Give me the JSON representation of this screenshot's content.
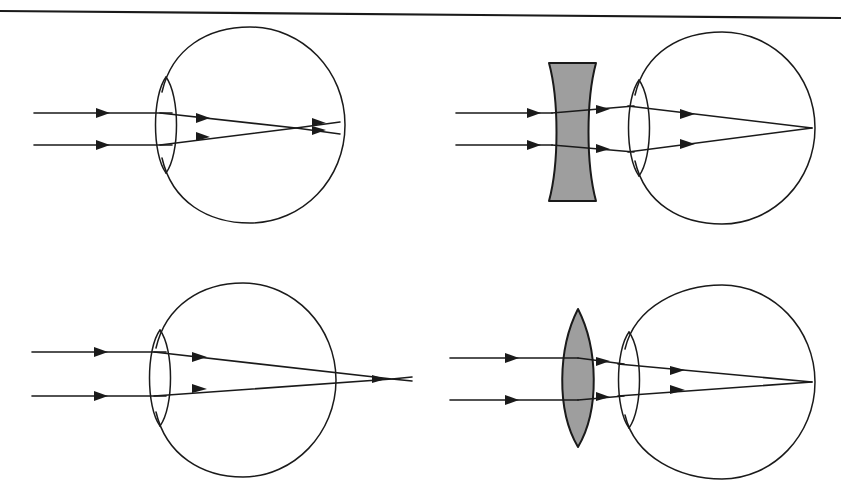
{
  "figure": {
    "kind": "optics-diagram",
    "width": 841,
    "height": 502,
    "background_color": "#ffffff",
    "ink_color": "#1a1a1a",
    "lens_fill_color": "#9e9e9e",
    "scan_edge_color": "#a8a8a8",
    "panel_count": 4
  },
  "scan_edge": {
    "name": "page-top-border",
    "x1": 0,
    "y1": 11,
    "x2": 841,
    "y2": 18,
    "color": "#a8a8a8"
  },
  "panels": [
    {
      "id": "top-left",
      "name": "myopia-uncorrected",
      "condition": "myopia",
      "corrective_lens": "none",
      "focal_point_relative_to_retina": "in front of retina",
      "eye": {
        "globe_cx": 250,
        "globe_cy": 125,
        "globe_rx": 95,
        "globe_ry": 98,
        "cornea_cx": 166,
        "cornea_cy": 125,
        "cornea_half_width": 16,
        "cornea_half_height": 48
      },
      "rays": [
        {
          "name": "upper-ray",
          "y_in": 113,
          "x_start": 34
        },
        {
          "name": "lower-ray",
          "y_in": 145,
          "x_start": 34
        }
      ],
      "focus": {
        "x": 296,
        "y": 128
      },
      "retina_hit_x": 340
    },
    {
      "id": "top-right",
      "name": "myopia-corrected-concave-lens",
      "condition": "myopia",
      "corrective_lens": "biconcave",
      "focal_point_relative_to_retina": "on retina",
      "lens": {
        "name": "concave-lens",
        "x_left": 549,
        "x_right": 596,
        "y_top": 63,
        "y_bottom": 201,
        "shape": "biconcave",
        "fill": "#9e9e9e"
      },
      "eye": {
        "globe_cx": 722,
        "globe_cy": 128,
        "globe_rx": 93,
        "globe_ry": 96,
        "cornea_cx": 639,
        "cornea_cy": 128,
        "cornea_half_width": 16,
        "cornea_half_height": 48
      },
      "rays": [
        {
          "name": "upper-ray",
          "y_in": 113,
          "x_start": 456
        },
        {
          "name": "lower-ray",
          "y_in": 145,
          "x_start": 456
        }
      ],
      "focus": {
        "x": 812,
        "y": 128
      },
      "retina_hit_x": 812
    },
    {
      "id": "bottom-left",
      "name": "hyperopia-uncorrected",
      "condition": "hyperopia",
      "corrective_lens": "none",
      "focal_point_relative_to_retina": "behind retina",
      "eye": {
        "globe_cx": 243,
        "globe_cy": 380,
        "globe_rx": 93,
        "globe_ry": 98,
        "cornea_cx": 160,
        "cornea_cy": 378,
        "cornea_half_width": 16,
        "cornea_half_height": 48
      },
      "rays": [
        {
          "name": "upper-ray",
          "y_in": 352,
          "x_start": 32
        },
        {
          "name": "lower-ray",
          "y_in": 396,
          "x_start": 32
        }
      ],
      "focus": {
        "x": 392,
        "y": 379
      },
      "retina_hit_x": 336
    },
    {
      "id": "bottom-right",
      "name": "hyperopia-corrected-convex-lens",
      "condition": "hyperopia",
      "corrective_lens": "biconvex",
      "focal_point_relative_to_retina": "on retina",
      "lens": {
        "name": "convex-lens",
        "x_left": 556,
        "x_right": 600,
        "y_top": 309,
        "y_bottom": 447,
        "shape": "biconvex",
        "fill": "#9e9e9e"
      },
      "eye": {
        "globe_cx": 722,
        "globe_cy": 382,
        "globe_rx": 93,
        "globe_ry": 97,
        "cornea_cx": 629,
        "cornea_cy": 380,
        "cornea_half_width": 16,
        "cornea_half_height": 48
      },
      "rays": [
        {
          "name": "upper-ray",
          "y_in": 358,
          "x_start": 450
        },
        {
          "name": "lower-ray",
          "y_in": 400,
          "x_start": 450
        }
      ],
      "focus": {
        "x": 812,
        "y": 382
      },
      "retina_hit_x": 812
    }
  ]
}
